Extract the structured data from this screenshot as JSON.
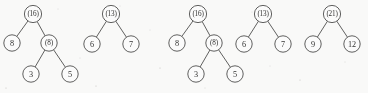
{
  "figure": {
    "kind": "binary-heap-tree-forest",
    "width": 368,
    "height": 93,
    "background_color": "#fdfdfc",
    "ink_color": "#4a4a48",
    "text_color": "#2b2b2a",
    "node_radius": 8.2,
    "root_node_radius": 8.6
  },
  "chart_data": {
    "type": "diagram",
    "title": "",
    "groups": [
      {
        "name": "group-1",
        "trees": [
          {
            "name": "tree-16",
            "root": "(16)",
            "nodes": [
              {
                "label": "(16)",
                "x": 33,
                "y": 14,
                "parenthesized": true,
                "role": "root"
              },
              {
                "label": "8",
                "x": 12,
                "y": 43,
                "parenthesized": false,
                "role": "leaf"
              },
              {
                "label": "(8)",
                "x": 49,
                "y": 43,
                "parenthesized": true,
                "role": "internal"
              },
              {
                "label": "3",
                "x": 31,
                "y": 74,
                "parenthesized": false,
                "role": "leaf"
              },
              {
                "label": "5",
                "x": 70,
                "y": 74,
                "parenthesized": false,
                "role": "leaf"
              }
            ],
            "edges": [
              {
                "from": "(16)",
                "to": "8"
              },
              {
                "from": "(16)",
                "to": "(8)"
              },
              {
                "from": "(8)",
                "to": "3"
              },
              {
                "from": "(8)",
                "to": "5"
              }
            ]
          },
          {
            "name": "tree-13",
            "root": "(13)",
            "nodes": [
              {
                "label": "(13)",
                "x": 111,
                "y": 14,
                "parenthesized": true,
                "role": "root"
              },
              {
                "label": "6",
                "x": 92,
                "y": 44,
                "parenthesized": false,
                "role": "leaf"
              },
              {
                "label": "7",
                "x": 131,
                "y": 44,
                "parenthesized": false,
                "role": "leaf"
              }
            ],
            "edges": [
              {
                "from": "(13)",
                "to": "6"
              },
              {
                "from": "(13)",
                "to": "7"
              }
            ]
          }
        ]
      },
      {
        "name": "group-2",
        "trees": [
          {
            "name": "tree-16-repeat",
            "root": "(16)",
            "nodes": [
              {
                "label": "(16)",
                "x": 198,
                "y": 14,
                "parenthesized": true,
                "role": "root"
              },
              {
                "label": "8",
                "x": 177,
                "y": 43,
                "parenthesized": false,
                "role": "leaf"
              },
              {
                "label": "(8)",
                "x": 214,
                "y": 43,
                "parenthesized": true,
                "role": "internal"
              },
              {
                "label": "3",
                "x": 196,
                "y": 74,
                "parenthesized": false,
                "role": "leaf"
              },
              {
                "label": "5",
                "x": 235,
                "y": 74,
                "parenthesized": false,
                "role": "leaf"
              }
            ],
            "edges": [
              {
                "from": "(16)",
                "to": "8"
              },
              {
                "from": "(16)",
                "to": "(8)"
              },
              {
                "from": "(8)",
                "to": "3"
              },
              {
                "from": "(8)",
                "to": "5"
              }
            ]
          },
          {
            "name": "tree-13-repeat",
            "root": "(13)",
            "nodes": [
              {
                "label": "(13)",
                "x": 263,
                "y": 14,
                "parenthesized": true,
                "role": "root"
              },
              {
                "label": "6",
                "x": 244,
                "y": 44,
                "parenthesized": false,
                "role": "leaf"
              },
              {
                "label": "7",
                "x": 283,
                "y": 44,
                "parenthesized": false,
                "role": "leaf"
              }
            ],
            "edges": [
              {
                "from": "(13)",
                "to": "6"
              },
              {
                "from": "(13)",
                "to": "7"
              }
            ]
          },
          {
            "name": "tree-21",
            "root": "(21)",
            "clipped_at_right_edge": true,
            "nodes": [
              {
                "label": "(21)",
                "x": 332,
                "y": 14,
                "parenthesized": true,
                "role": "root"
              },
              {
                "label": "9",
                "x": 313,
                "y": 44,
                "parenthesized": false,
                "role": "leaf"
              },
              {
                "label": "12",
                "x": 352,
                "y": 44,
                "parenthesized": false,
                "role": "leaf",
                "clipped": true
              }
            ],
            "edges": [
              {
                "from": "(21)",
                "to": "9"
              },
              {
                "from": "(21)",
                "to": "12"
              }
            ]
          }
        ]
      }
    ]
  }
}
